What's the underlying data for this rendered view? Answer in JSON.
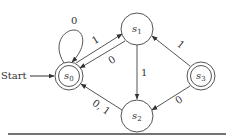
{
  "diagram": {
    "type": "finite-state-machine",
    "start_label": "Start",
    "states": [
      {
        "id": "s0",
        "name": "s",
        "sub": "0",
        "final": true,
        "start": true
      },
      {
        "id": "s1",
        "name": "s",
        "sub": "1",
        "final": false,
        "start": false
      },
      {
        "id": "s2",
        "name": "s",
        "sub": "2",
        "final": false,
        "start": false
      },
      {
        "id": "s3",
        "name": "s",
        "sub": "3",
        "final": true,
        "start": false
      }
    ],
    "transitions": [
      {
        "from": "s0",
        "to": "s0",
        "label": "0"
      },
      {
        "from": "s0",
        "to": "s1",
        "label": "1"
      },
      {
        "from": "s1",
        "to": "s0",
        "label": "0"
      },
      {
        "from": "s1",
        "to": "s2",
        "label": "1"
      },
      {
        "from": "s3",
        "to": "s1",
        "label": "1"
      },
      {
        "from": "s3",
        "to": "s2",
        "label": "0"
      },
      {
        "from": "s2",
        "to": "s0",
        "label": "0, 1"
      }
    ],
    "colors": {
      "stroke": "#555555",
      "text": "#333333",
      "rule": "#444444"
    }
  }
}
